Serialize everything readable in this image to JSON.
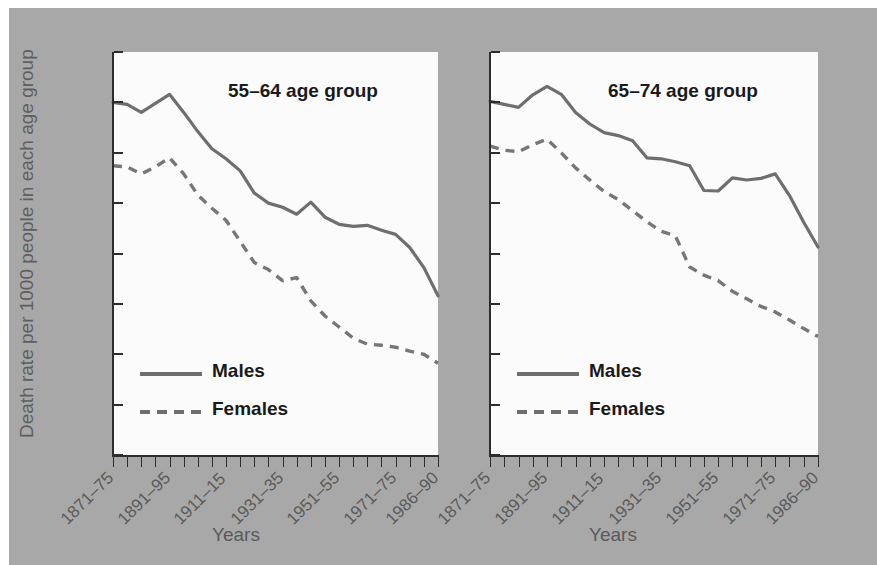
{
  "figure": {
    "background_color": "#a8a8a8",
    "plot_background_color": "#fbfbfb",
    "y_axis_title": "Death rate per 1000 people in each age group",
    "x_axis_title_left": "Years",
    "x_axis_title_right": "Years",
    "legend": {
      "males_label": "Males",
      "females_label": "Females",
      "males_color": "#6e6e6e",
      "females_color": "#767676"
    }
  },
  "chart_data": [
    {
      "type": "line",
      "title": "55–64 age group",
      "xlabel": "Years",
      "ylabel": "Death rate per 1000 people in each age group",
      "ylim": [
        0,
        40
      ],
      "yticks": [
        0,
        5,
        10,
        15,
        20,
        25,
        30,
        35,
        40
      ],
      "grid": false,
      "legend_position": "lower-left-inside",
      "categories": [
        "1871–75",
        "1876–80",
        "1881–85",
        "1886–90",
        "1891–95",
        "1896–1900",
        "1901–05",
        "1906–10",
        "1911–15",
        "1916–20",
        "1921–25",
        "1926–30",
        "1931–35",
        "1936–40",
        "1941–45",
        "1946–50",
        "1951–55",
        "1956–60",
        "1961–65",
        "1966–70",
        "1971–75",
        "1976–80",
        "1981–85",
        "1986–90"
      ],
      "tick_labels_shown": [
        "1871–75",
        "1891–95",
        "1911–15",
        "1931–35",
        "1951–55",
        "1971–75",
        "1986–90"
      ],
      "series": [
        {
          "name": "Males",
          "style": "solid",
          "values": [
            35.0,
            34.8,
            34.0,
            34.9,
            35.8,
            34.0,
            32.1,
            30.4,
            29.4,
            28.2,
            26.0,
            25.0,
            24.6,
            23.9,
            25.1,
            23.6,
            22.9,
            22.7,
            22.8,
            22.3,
            21.9,
            20.6,
            18.6,
            15.8
          ]
        },
        {
          "name": "Females",
          "style": "dashed",
          "values": [
            28.7,
            28.6,
            27.9,
            28.6,
            29.5,
            27.9,
            25.8,
            24.5,
            23.3,
            21.2,
            19.1,
            18.4,
            17.3,
            17.6,
            15.3,
            13.8,
            12.7,
            11.6,
            11.0,
            10.9,
            10.7,
            10.3,
            10.0,
            9.1
          ]
        }
      ]
    },
    {
      "type": "line",
      "title": "65–74 age group",
      "xlabel": "Years",
      "ylabel": "Death rate per 1000 people in each age group",
      "ylim": [
        0,
        80
      ],
      "yticks": [
        0,
        10,
        20,
        30,
        40,
        50,
        60,
        70,
        80
      ],
      "grid": false,
      "legend_position": "lower-left-inside",
      "categories": [
        "1871–75",
        "1876–80",
        "1881–85",
        "1886–90",
        "1891–95",
        "1896–1900",
        "1901–05",
        "1906–10",
        "1911–15",
        "1916–20",
        "1921–25",
        "1926–30",
        "1931–35",
        "1936–40",
        "1941–45",
        "1946–50",
        "1951–55",
        "1956–60",
        "1961–65",
        "1966–70",
        "1971–75",
        "1976–80",
        "1981–85",
        "1986–90"
      ],
      "tick_labels_shown": [
        "1871–75",
        "1891–95",
        "1911–15",
        "1931–35",
        "1951–55",
        "1971–75",
        "1986–90"
      ],
      "series": [
        {
          "name": "Males",
          "style": "solid",
          "values": [
            70.2,
            69.6,
            69.0,
            71.5,
            73.2,
            71.6,
            68.0,
            65.7,
            64.0,
            63.4,
            62.4,
            59.0,
            58.8,
            58.2,
            57.4,
            52.5,
            52.4,
            55.0,
            54.6,
            54.9,
            55.8,
            51.5,
            46.2,
            41.3
          ]
        },
        {
          "name": "Females",
          "style": "dashed",
          "values": [
            61.3,
            60.5,
            60.2,
            61.6,
            62.7,
            60.0,
            57.0,
            54.6,
            52.3,
            50.7,
            48.5,
            46.3,
            44.4,
            43.5,
            37.3,
            35.7,
            34.6,
            32.5,
            31.0,
            29.5,
            28.4,
            26.8,
            25.1,
            23.5
          ]
        }
      ]
    }
  ]
}
